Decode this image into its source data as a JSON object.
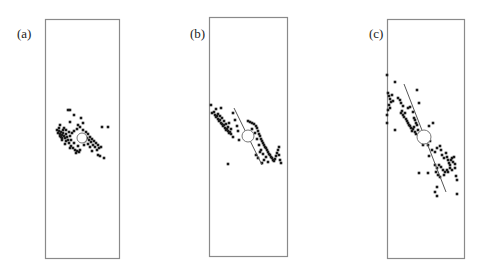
{
  "chart_data": [
    {
      "type": "scatter",
      "label": "(a)",
      "title": "",
      "xlabel": "",
      "ylabel": "",
      "grid": false,
      "box": {
        "x": 45,
        "y": 19,
        "w": 74,
        "h": 239
      },
      "center_marker": {
        "shape": "open-circle",
        "cx": 82,
        "cy": 138,
        "r": 5
      },
      "fit_line": null,
      "points": [
        [
          57,
          130
        ],
        [
          58,
          133
        ],
        [
          59,
          131
        ],
        [
          60,
          134
        ],
        [
          61,
          132
        ],
        [
          62,
          135
        ],
        [
          61,
          137
        ],
        [
          63,
          133
        ],
        [
          64,
          136
        ],
        [
          65,
          138
        ],
        [
          62,
          138
        ],
        [
          60,
          136
        ],
        [
          59,
          128
        ],
        [
          63,
          130
        ],
        [
          66,
          134
        ],
        [
          67,
          137
        ],
        [
          68,
          140
        ],
        [
          66,
          141
        ],
        [
          69,
          143
        ],
        [
          71,
          146
        ],
        [
          73,
          148
        ],
        [
          75,
          150
        ],
        [
          77,
          151
        ],
        [
          79,
          152
        ],
        [
          80,
          150
        ],
        [
          78,
          146
        ],
        [
          74,
          143
        ],
        [
          71,
          140
        ],
        [
          70,
          136
        ],
        [
          72,
          133
        ],
        [
          74,
          131
        ],
        [
          77,
          129
        ],
        [
          80,
          127
        ],
        [
          83,
          130
        ],
        [
          86,
          132
        ],
        [
          88,
          134
        ],
        [
          90,
          137
        ],
        [
          92,
          139
        ],
        [
          94,
          141
        ],
        [
          96,
          143
        ],
        [
          98,
          145
        ],
        [
          99,
          148
        ],
        [
          97,
          150
        ],
        [
          95,
          147
        ],
        [
          93,
          145
        ],
        [
          91,
          142
        ],
        [
          89,
          140
        ],
        [
          87,
          138
        ],
        [
          85,
          141
        ],
        [
          88,
          144
        ],
        [
          90,
          147
        ],
        [
          92,
          151
        ],
        [
          98,
          155
        ],
        [
          100,
          156
        ],
        [
          104,
          158
        ],
        [
          101,
          147
        ],
        [
          102,
          127
        ],
        [
          108,
          127
        ],
        [
          68,
          110
        ],
        [
          70,
          110
        ],
        [
          74,
          115
        ],
        [
          81,
          118
        ],
        [
          70,
          122
        ],
        [
          78,
          125
        ],
        [
          83,
          123
        ],
        [
          60,
          125
        ],
        [
          64,
          128
        ],
        [
          66,
          130
        ],
        [
          69,
          132
        ],
        [
          62,
          140
        ],
        [
          65,
          144
        ],
        [
          70,
          148
        ],
        [
          76,
          153
        ],
        [
          84,
          145
        ]
      ]
    },
    {
      "type": "scatter",
      "label": "(b)",
      "title": "",
      "xlabel": "",
      "ylabel": "",
      "grid": false,
      "box": {
        "x": 209,
        "y": 17,
        "w": 78,
        "h": 239
      },
      "center_marker": {
        "shape": "open-circle",
        "cx": 248,
        "cy": 136,
        "r": 6
      },
      "fit_line": {
        "x1": 234,
        "y1": 108,
        "x2": 262,
        "y2": 165
      },
      "points": [
        [
          211,
          105
        ],
        [
          212,
          113
        ],
        [
          214,
          112
        ],
        [
          215,
          115
        ],
        [
          216,
          117
        ],
        [
          217,
          116
        ],
        [
          218,
          119
        ],
        [
          219,
          121
        ],
        [
          220,
          120
        ],
        [
          221,
          123
        ],
        [
          222,
          124
        ],
        [
          223,
          126
        ],
        [
          224,
          125
        ],
        [
          225,
          128
        ],
        [
          226,
          130
        ],
        [
          227,
          129
        ],
        [
          228,
          131
        ],
        [
          229,
          133
        ],
        [
          230,
          132
        ],
        [
          231,
          134
        ],
        [
          228,
          127
        ],
        [
          226,
          124
        ],
        [
          224,
          121
        ],
        [
          222,
          118
        ],
        [
          220,
          116
        ],
        [
          218,
          114
        ],
        [
          216,
          109
        ],
        [
          221,
          108
        ],
        [
          233,
          113
        ],
        [
          235,
          120
        ],
        [
          237,
          126
        ],
        [
          238,
          131
        ],
        [
          239,
          140
        ],
        [
          233,
          137
        ],
        [
          231,
          129
        ],
        [
          229,
          123
        ],
        [
          228,
          164
        ],
        [
          248,
          121
        ],
        [
          250,
          122
        ],
        [
          252,
          123
        ],
        [
          254,
          124
        ],
        [
          256,
          126
        ],
        [
          257,
          128
        ],
        [
          258,
          131
        ],
        [
          259,
          134
        ],
        [
          260,
          136
        ],
        [
          261,
          139
        ],
        [
          262,
          141
        ],
        [
          263,
          143
        ],
        [
          264,
          145
        ],
        [
          265,
          147
        ],
        [
          266,
          148
        ],
        [
          267,
          150
        ],
        [
          268,
          152
        ],
        [
          269,
          154
        ],
        [
          270,
          155
        ],
        [
          271,
          157
        ],
        [
          272,
          158
        ],
        [
          273,
          160
        ],
        [
          274,
          161
        ],
        [
          275,
          159
        ],
        [
          276,
          156
        ],
        [
          277,
          153
        ],
        [
          278,
          150
        ],
        [
          279,
          155
        ],
        [
          280,
          160
        ],
        [
          281,
          163
        ],
        [
          279,
          147
        ],
        [
          256,
          155
        ],
        [
          258,
          158
        ],
        [
          260,
          152
        ],
        [
          262,
          163
        ],
        [
          264,
          160
        ],
        [
          266,
          157
        ],
        [
          268,
          162
        ],
        [
          252,
          129
        ],
        [
          255,
          133
        ],
        [
          257,
          139
        ],
        [
          259,
          145
        ],
        [
          261,
          150
        ],
        [
          263,
          154
        ]
      ]
    },
    {
      "type": "scatter",
      "label": "(c)",
      "title": "",
      "xlabel": "",
      "ylabel": "",
      "grid": false,
      "box": {
        "x": 387,
        "y": 19,
        "w": 77,
        "h": 239
      },
      "center_marker": {
        "shape": "open-circle",
        "cx": 424,
        "cy": 137,
        "r": 7
      },
      "fit_line": {
        "x1": 404,
        "y1": 84,
        "x2": 446,
        "y2": 192
      },
      "points": [
        [
          387,
          75
        ],
        [
          388,
          93
        ],
        [
          389,
          96
        ],
        [
          390,
          99
        ],
        [
          391,
          102
        ],
        [
          389,
          105
        ],
        [
          390,
          108
        ],
        [
          388,
          110
        ],
        [
          387,
          115
        ],
        [
          387,
          123
        ],
        [
          395,
          82
        ],
        [
          392,
          95
        ],
        [
          393,
          101
        ],
        [
          398,
          98
        ],
        [
          400,
          100
        ],
        [
          401,
          103
        ],
        [
          403,
          106
        ],
        [
          402,
          111
        ],
        [
          401,
          113
        ],
        [
          403,
          115
        ],
        [
          405,
          113
        ],
        [
          404,
          117
        ],
        [
          406,
          119
        ],
        [
          407,
          121
        ],
        [
          408,
          123
        ],
        [
          409,
          125
        ],
        [
          410,
          126
        ],
        [
          411,
          128
        ],
        [
          412,
          131
        ],
        [
          413,
          129
        ],
        [
          414,
          127
        ],
        [
          415,
          132
        ],
        [
          416,
          134
        ],
        [
          418,
          130
        ],
        [
          417,
          125
        ],
        [
          416,
          123
        ],
        [
          415,
          120
        ],
        [
          414,
          118
        ],
        [
          413,
          112
        ],
        [
          408,
          108
        ],
        [
          419,
          103
        ],
        [
          417,
          90
        ],
        [
          410,
          107
        ],
        [
          395,
          130
        ],
        [
          421,
          140
        ],
        [
          423,
          145
        ],
        [
          428,
          145
        ],
        [
          430,
          141
        ],
        [
          433,
          123
        ],
        [
          429,
          126
        ],
        [
          432,
          150
        ],
        [
          435,
          152
        ],
        [
          437,
          148
        ],
        [
          440,
          146
        ],
        [
          441,
          150
        ],
        [
          442,
          155
        ],
        [
          444,
          158
        ],
        [
          446,
          153
        ],
        [
          447,
          157
        ],
        [
          448,
          160
        ],
        [
          449,
          163
        ],
        [
          450,
          165
        ],
        [
          451,
          160
        ],
        [
          452,
          158
        ],
        [
          453,
          162
        ],
        [
          455,
          164
        ],
        [
          454,
          157
        ],
        [
          450,
          168
        ],
        [
          447,
          170
        ],
        [
          445,
          172
        ],
        [
          443,
          170
        ],
        [
          441,
          167
        ],
        [
          439,
          165
        ],
        [
          437,
          168
        ],
        [
          435,
          165
        ],
        [
          436,
          172
        ],
        [
          438,
          175
        ],
        [
          440,
          177
        ],
        [
          444,
          175
        ],
        [
          448,
          172
        ],
        [
          452,
          170
        ],
        [
          456,
          176
        ],
        [
          457,
          180
        ],
        [
          455,
          168
        ],
        [
          429,
          156
        ],
        [
          419,
          173
        ],
        [
          428,
          173
        ],
        [
          437,
          187
        ],
        [
          435,
          192
        ],
        [
          437,
          196
        ],
        [
          457,
          194
        ]
      ]
    }
  ],
  "panels": [
    {
      "label": "(a)"
    },
    {
      "label": "(b)"
    },
    {
      "label": "(c)"
    }
  ],
  "colors": {
    "point": "#1a1a1a",
    "box": "#8a8a8a",
    "line": "#555555",
    "background": "#ffffff"
  }
}
